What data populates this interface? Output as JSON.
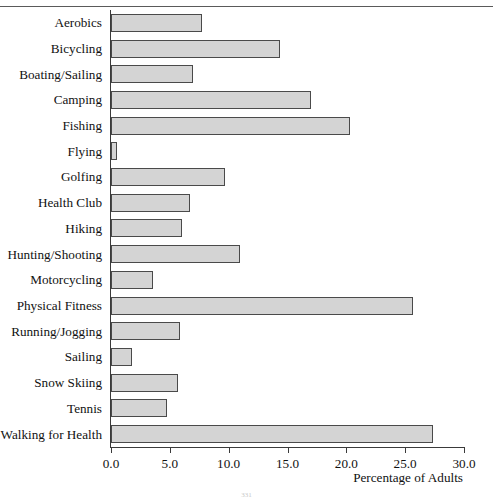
{
  "figure": {
    "xlabel": "Percentage of Adults",
    "page_number": "331"
  },
  "chart_data": {
    "type": "bar",
    "orientation": "horizontal",
    "title": "",
    "subtitle": "",
    "xlabel": "Percentage of Adults",
    "ylabel": "",
    "xlim": [
      0.0,
      30.0
    ],
    "xticks": [
      0.0,
      5.0,
      10.0,
      15.0,
      20.0,
      25.0,
      30.0
    ],
    "xtick_labels": [
      "0.0",
      "5.0",
      "10.0",
      "15.0",
      "20.0",
      "25.0",
      "30.0"
    ],
    "grid": false,
    "legend": null,
    "bar_fill_color": "#d4d4d4",
    "bar_edge_color": "#4a4a4a",
    "categories": [
      "Aerobics",
      "Bicycling",
      "Boating/Sailing",
      "Camping",
      "Fishing",
      "Flying",
      "Golfing",
      "Health Club",
      "Hiking",
      "Hunting/Shooting",
      "Motorcycling",
      "Physical Fitness",
      "Running/Jogging",
      "Sailing",
      "Snow Skiing",
      "Tennis",
      "Walking for Health"
    ],
    "values": [
      7.7,
      14.4,
      7.0,
      17.0,
      20.3,
      0.5,
      9.7,
      6.7,
      6.0,
      11.0,
      3.6,
      25.7,
      5.9,
      1.8,
      5.7,
      4.8,
      27.4
    ]
  }
}
